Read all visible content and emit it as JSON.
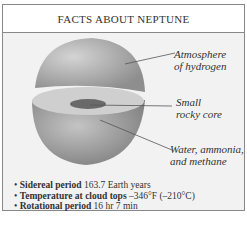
{
  "title": "FACTS ABOUT NEPTUNE",
  "labels": {
    "atmosphere": [
      "Atmosphere",
      "of hydrogen"
    ],
    "core": [
      "Small",
      "rocky core"
    ],
    "mantle": [
      "Water, ammonia,",
      "and methane"
    ]
  },
  "facts": [
    {
      "bullet": "•",
      "label": "Sidereal period",
      "value": "163.7 Earth years"
    },
    {
      "bullet": "•",
      "label": "Temperature at cloud tops",
      "value": "–346°F (–210°C)"
    },
    {
      "bullet": "•",
      "label": "Rotational period",
      "value": "16 hr 7 min"
    }
  ],
  "colors": {
    "planet": "#a8a8a8",
    "core": "#6a6a6a",
    "frame": "#888888"
  }
}
